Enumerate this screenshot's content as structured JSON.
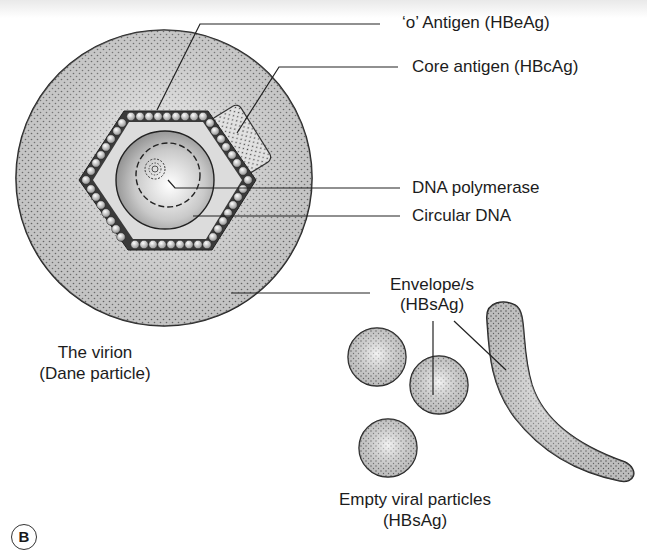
{
  "figure": {
    "panel_tag": "B",
    "labels": {
      "e_antigen": "‘o’ Antigen (HBeAg)",
      "core_antigen": "Core antigen (HBcAg)",
      "dna_polymerase": "DNA polymerase",
      "circular_dna": "Circular DNA",
      "envelope_line1": "Envelope/s",
      "envelope_line2": "(HBsAg)",
      "virion_line1": "The virion",
      "virion_line2": "(Dane particle)",
      "empty_line1": "Empty viral particles",
      "empty_line2": "(HBsAg)"
    },
    "parts": [
      "outer-envelope",
      "capsid-hexagon",
      "core-antigen-protrusion",
      "inner-core-sphere",
      "circular-dna",
      "dna-polymerase",
      "empty-spheres",
      "filamentous-particle"
    ],
    "colors": {
      "outline": "#222222",
      "stipple_bg": "#d8d8d8",
      "hexagon_band": "#3a3a3a",
      "inner_fill": "#d9d9d9"
    }
  }
}
